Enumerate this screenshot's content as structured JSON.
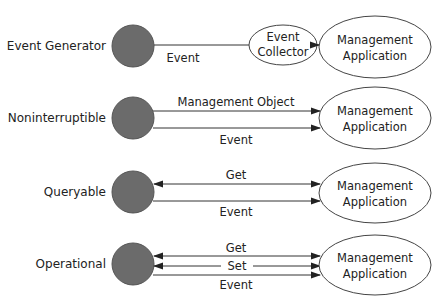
{
  "diagram": {
    "colors": {
      "node_fill": "#6b6b6b",
      "node_stroke": "#555555",
      "line": "#333333",
      "ellipse_stroke": "#444444",
      "text": "#222222",
      "background": "#ffffff"
    },
    "rows": [
      {
        "label": "Event Generator",
        "collector": {
          "line1": "Event",
          "line2": "Collector"
        },
        "arrows": [
          {
            "label": "Event",
            "direction": "to-collector"
          }
        ],
        "target": {
          "line1": "Management",
          "line2": "Application"
        }
      },
      {
        "label": "Noninterruptible",
        "arrows": [
          {
            "label": "Management Object",
            "direction": "right"
          },
          {
            "label": "Event",
            "direction": "right"
          }
        ],
        "target": {
          "line1": "Management",
          "line2": "Application"
        }
      },
      {
        "label": "Queryable",
        "arrows": [
          {
            "label": "Get",
            "direction": "both"
          },
          {
            "label": "Event",
            "direction": "right"
          }
        ],
        "target": {
          "line1": "Management",
          "line2": "Application"
        }
      },
      {
        "label": "Operational",
        "arrows": [
          {
            "label": "Get",
            "direction": "both"
          },
          {
            "label": "Set",
            "direction": "both"
          },
          {
            "label": "Event",
            "direction": "right"
          }
        ],
        "target": {
          "line1": "Management",
          "line2": "Application"
        }
      }
    ]
  }
}
